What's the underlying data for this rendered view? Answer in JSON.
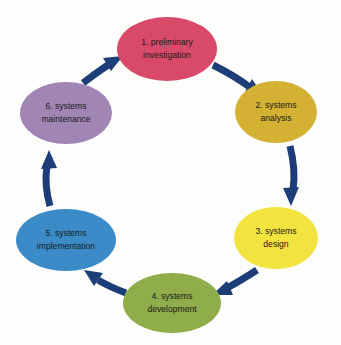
{
  "diagram": {
    "type": "cycle",
    "background_color": "#fdfdfc",
    "arrow_color": "#1c3d77",
    "label_color": "#1a1a1a",
    "direction": "clockwise",
    "nodes": [
      {
        "id": "preliminary-investigation",
        "number": "1.",
        "line1": "1. preliminary",
        "line2": "investigation",
        "color": "#D94A6A",
        "cx": 167,
        "cy": 49,
        "rx": 50,
        "ry": 32
      },
      {
        "id": "systems-analysis",
        "number": "2.",
        "line1": "2. systems",
        "line2": "analysis",
        "color": "#D4B132",
        "cx": 276,
        "cy": 112,
        "rx": 41,
        "ry": 31
      },
      {
        "id": "systems-design",
        "number": "3.",
        "line1": "3. systems",
        "line2": "design",
        "color": "#F2E33F",
        "cx": 276,
        "cy": 238,
        "rx": 42,
        "ry": 31
      },
      {
        "id": "systems-development",
        "number": "4.",
        "line1": "4. systems",
        "line2": "development",
        "color": "#8FAD4A",
        "cx": 172,
        "cy": 303,
        "rx": 49,
        "ry": 30
      },
      {
        "id": "systems-implementation",
        "number": "5.",
        "line1": "5. systems",
        "line2": "implementation",
        "color": "#3A8BC8",
        "cx": 66,
        "cy": 240,
        "rx": 50,
        "ry": 31
      },
      {
        "id": "systems-maintenance",
        "number": "6.",
        "line1": "6. systems",
        "line2": "maintenance",
        "color": "#A186B5",
        "cx": 66,
        "cy": 113,
        "rx": 46,
        "ry": 31
      }
    ],
    "arrows": [
      {
        "id": "arrow-1-to-2",
        "from": "preliminary-investigation",
        "to": "systems-analysis"
      },
      {
        "id": "arrow-2-to-3",
        "from": "systems-analysis",
        "to": "systems-design"
      },
      {
        "id": "arrow-3-to-4",
        "from": "systems-design",
        "to": "systems-development"
      },
      {
        "id": "arrow-4-to-5",
        "from": "systems-development",
        "to": "systems-implementation"
      },
      {
        "id": "arrow-5-to-6",
        "from": "systems-implementation",
        "to": "systems-maintenance"
      },
      {
        "id": "arrow-6-to-1",
        "from": "systems-maintenance",
        "to": "preliminary-investigation"
      }
    ]
  }
}
